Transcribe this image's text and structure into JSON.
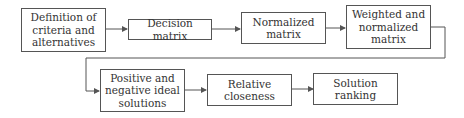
{
  "diagram": {
    "type": "flowchart",
    "nodes": [
      {
        "id": "definition",
        "label": "Definition of criteria and alternatives",
        "lines": [
          "Definition of",
          "criteria and",
          "alternatives"
        ]
      },
      {
        "id": "decision",
        "label": "Decision matrix",
        "lines": [
          "Decision matrix"
        ]
      },
      {
        "id": "normalized",
        "label": "Normalized matrix",
        "lines": [
          "Normalized",
          "matrix"
        ]
      },
      {
        "id": "weighted",
        "label": "Weighted and normalized matrix",
        "lines": [
          "Weighted and",
          "normalized",
          "matrix"
        ]
      },
      {
        "id": "ideal",
        "label": "Positive and negative ideal solutions",
        "lines": [
          "Positive and",
          "negative ideal",
          "solutions"
        ]
      },
      {
        "id": "closeness",
        "label": "Relative closeness",
        "lines": [
          "Relative",
          "closeness"
        ]
      },
      {
        "id": "ranking",
        "label": "Solution ranking",
        "lines": [
          "Solution",
          "ranking"
        ]
      }
    ],
    "edges": [
      {
        "from": "definition",
        "to": "decision"
      },
      {
        "from": "decision",
        "to": "normalized"
      },
      {
        "from": "normalized",
        "to": "weighted"
      },
      {
        "from": "weighted",
        "to": "ideal"
      },
      {
        "from": "ideal",
        "to": "closeness"
      },
      {
        "from": "closeness",
        "to": "ranking"
      }
    ]
  }
}
